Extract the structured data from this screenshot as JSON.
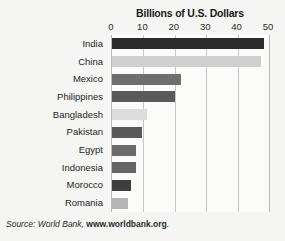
{
  "chart_data": {
    "type": "bar",
    "orientation": "horizontal",
    "title": "Billions of U.S. Dollars",
    "xlabel": "",
    "ylabel": "",
    "xlim": [
      0,
      50
    ],
    "xticks": [
      0,
      10,
      20,
      30,
      40,
      50
    ],
    "grid": true,
    "legend": "none",
    "categories": [
      "India",
      "China",
      "Mexico",
      "Philippines",
      "Bangladesh",
      "Pakistan",
      "Egypt",
      "Indonesia",
      "Morocco",
      "Romania"
    ],
    "values": [
      48.5,
      47.5,
      22,
      20,
      11,
      9.5,
      7.5,
      7.5,
      6,
      5
    ],
    "bar_colors": [
      "#2b2b2b",
      "#cfcfcf",
      "#6e6e6e",
      "#5a5a5a",
      "#dcdcdc",
      "#595959",
      "#6b6b6b",
      "#656565",
      "#3d3d3d",
      "#b5b5b5"
    ],
    "bars": [
      {
        "label": "India",
        "value": 48.5,
        "color": "#2b2b2b"
      },
      {
        "label": "China",
        "value": 47.5,
        "color": "#cfcfcf"
      },
      {
        "label": "Mexico",
        "value": 22,
        "color": "#6e6e6e"
      },
      {
        "label": "Philippines",
        "value": 20,
        "color": "#5a5a5a"
      },
      {
        "label": "Bangladesh",
        "value": 11,
        "color": "#dcdcdc"
      },
      {
        "label": "Pakistan",
        "value": 9.5,
        "color": "#595959"
      },
      {
        "label": "Egypt",
        "value": 7.5,
        "color": "#6b6b6b"
      },
      {
        "label": "Indonesia",
        "value": 7.5,
        "color": "#656565"
      },
      {
        "label": "Morocco",
        "value": 6,
        "color": "#3d3d3d"
      },
      {
        "label": "Romania",
        "value": 5,
        "color": "#b5b5b5"
      }
    ]
  },
  "source": {
    "prefix": "Source: World Bank, ",
    "url": "www.worldbank.org",
    "suffix": "."
  },
  "colors": {
    "background": "#f5f5f3",
    "plot_background": "#fbfbfa",
    "gridline": "#c6c6c6",
    "text": "#1a1a1a"
  }
}
